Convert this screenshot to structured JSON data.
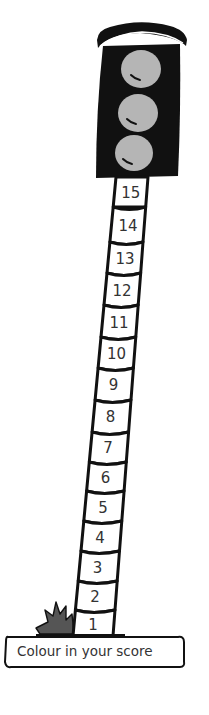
{
  "worksheet": {
    "instruction": "Colour in your score",
    "traffic_light": {
      "lights": [
        {
          "name": "top-light",
          "color": "#b5b5b5"
        },
        {
          "name": "middle-light",
          "color": "#b5b5b5"
        },
        {
          "name": "bottom-light",
          "color": "#b5b5b5"
        }
      ],
      "housing_color": "#111111"
    },
    "pole": {
      "segments": [
        {
          "value": "15"
        },
        {
          "value": "14"
        },
        {
          "value": "13"
        },
        {
          "value": "12"
        },
        {
          "value": "11"
        },
        {
          "value": "10"
        },
        {
          "value": "9"
        },
        {
          "value": "8"
        },
        {
          "value": "7"
        },
        {
          "value": "6"
        },
        {
          "value": "5"
        },
        {
          "value": "4"
        },
        {
          "value": "3"
        },
        {
          "value": "2"
        },
        {
          "value": "1"
        }
      ]
    },
    "grass_icon": "grass-tuft-icon"
  }
}
